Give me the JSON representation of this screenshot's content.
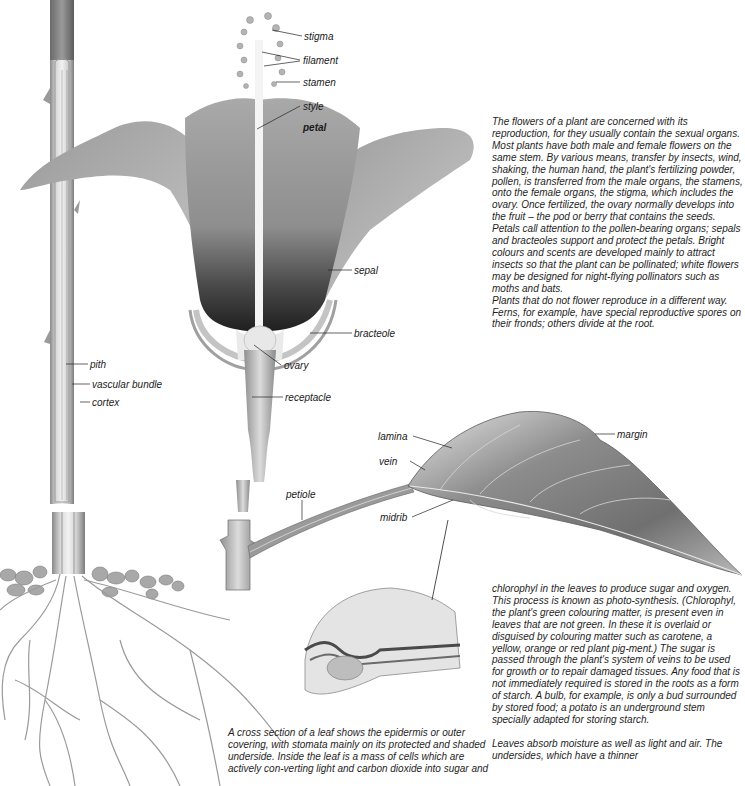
{
  "figure": {
    "labels": {
      "stigma": "stigma",
      "filament": "filament",
      "stamen": "stamen",
      "style": "style",
      "petal": "petal",
      "sepal": "sepal",
      "bracteole": "bracteole",
      "ovary": "ovary",
      "receptacle": "receptacle",
      "pith": "pith",
      "vascular_bundle": "vascular bundle",
      "cortex": "cortex",
      "lamina": "lamina",
      "vein": "vein",
      "petiole": "petiole",
      "midrib": "midrib",
      "margin": "margin"
    }
  },
  "text": {
    "flowers_paragraph": "The flowers of a plant are concerned with its reproduction, for they usually contain the sexual organs. Most plants have both male and female flowers on the same stem. By various means, transfer by insects, wind, shaking, the human hand, the plant's fertilizing powder, pollen, is transferred from the male organs, the stamens, onto the female organs, the stigma, which includes the ovary. Once fertilized, the ovary normally develops into the fruit – the pod or berry that contains the seeds.",
    "petals_paragraph": "Petals call attention to the pollen-bearing organs; sepals and bracteoles support and protect the petals. Bright colours and scents are developed mainly to attract insects so that the plant can be pollinated; white flowers may be designed for night-flying pollinators such as moths and bats.",
    "nonflowering_paragraph": "Plants that do not flower reproduce in a different way. Ferns, for example, have special reproductive spores on their fronds; others divide at the root.",
    "chlorophyl_paragraph": "chlorophyl in the leaves to produce sugar and oxygen. This process is known as photo-synthesis. (Chlorophyl, the plant's green colouring matter, is present even in leaves that are not green. In these it is overlaid or disguised by colouring matter such as carotene, a yellow, orange or red plant pig-ment.) The sugar is passed through the plant's system of veins to be used for growth or to repair damaged tissues. Any food that is not immediately required is stored in the roots as a form of starch. A bulb, for example, is only a bud surrounded by stored food; a potato is an underground stem specially adapted for storing starch.",
    "leaves_paragraph": "Leaves absorb moisture as well as light and air. The undersides, which have a thinner",
    "cross_section_caption": "A cross section of a leaf shows the epidermis or outer covering, with stomata mainly on its protected and shaded underside. Inside the leaf is a mass of cells which are actively con-verting light and carbon dioxide into sugar and"
  }
}
